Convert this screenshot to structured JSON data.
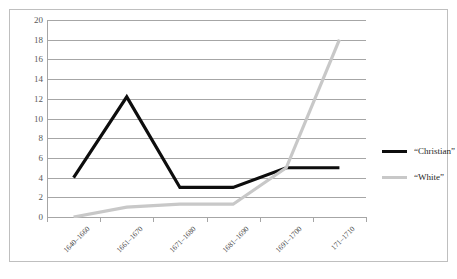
{
  "chart_data": {
    "type": "line",
    "title": "",
    "xlabel": "",
    "ylabel": "",
    "ylim": [
      0,
      20
    ],
    "ytick_step": 2,
    "yticks": [
      20,
      18,
      16,
      14,
      12,
      10,
      8,
      6,
      4,
      2,
      0
    ],
    "grid": true,
    "legend_position": "right",
    "categories": [
      "1640–1660",
      "1661–1670",
      "1671–1680",
      "1681–1690",
      "1691–1700",
      "171–1710"
    ],
    "series": [
      {
        "name": "“Christian”",
        "color": "#0d0d0d",
        "line_width": 3.2,
        "values": [
          4,
          12.2,
          3,
          3,
          5,
          5
        ]
      },
      {
        "name": "“White”",
        "color": "#c8c8c8",
        "line_width": 3.2,
        "values": [
          0,
          1,
          1.3,
          1.3,
          5,
          18
        ]
      }
    ]
  },
  "style": {
    "grid_color": "#a6a6a6",
    "axis_color": "#a6a6a6",
    "frame_color": "#bfbfbf",
    "tick_text_color": "#595959",
    "label_text_color": "#3f3f3f",
    "background": "#ffffff"
  }
}
